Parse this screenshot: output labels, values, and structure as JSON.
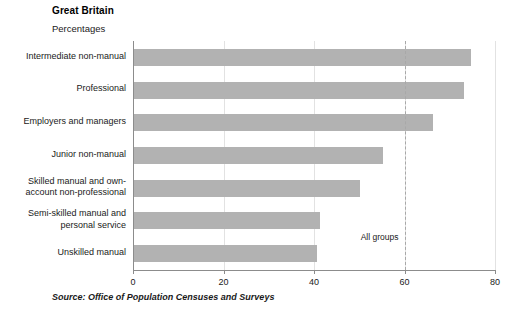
{
  "header": {
    "title": "Great Britain",
    "subtitle": "Percentages"
  },
  "source": {
    "text": "Source: Office of Population Censuses and Surveys"
  },
  "colors": {
    "bar_fill": "#b2b2b2",
    "axis": "#8c8c8c",
    "gridline": "#e2e2e2",
    "reference_line": "#a8a8a8",
    "text": "#1a1a1a",
    "background": "#ffffff"
  },
  "chart_data": {
    "type": "bar",
    "orientation": "horizontal",
    "title": "Great Britain",
    "subtitle": "Percentages",
    "xlabel": "",
    "ylabel": "",
    "xlim": [
      0,
      80
    ],
    "xticks": [
      0,
      20,
      40,
      60,
      80
    ],
    "xtick_labels": [
      "0",
      "20",
      "40",
      "60",
      "80"
    ],
    "grid": true,
    "legend": false,
    "categories": [
      "Intermediate non-manual",
      "Professional",
      "Employers and managers",
      "Junior non-manual",
      "Skilled manual and own-\naccount non-professional",
      "Semi-skilled manual and\npersonal service",
      "Unskilled manual"
    ],
    "values": [
      74.5,
      73,
      66,
      55,
      50,
      41,
      40.5
    ],
    "annotations": [
      {
        "label": "All groups",
        "value": 60,
        "type": "reference-line",
        "style": "dashed"
      }
    ]
  }
}
